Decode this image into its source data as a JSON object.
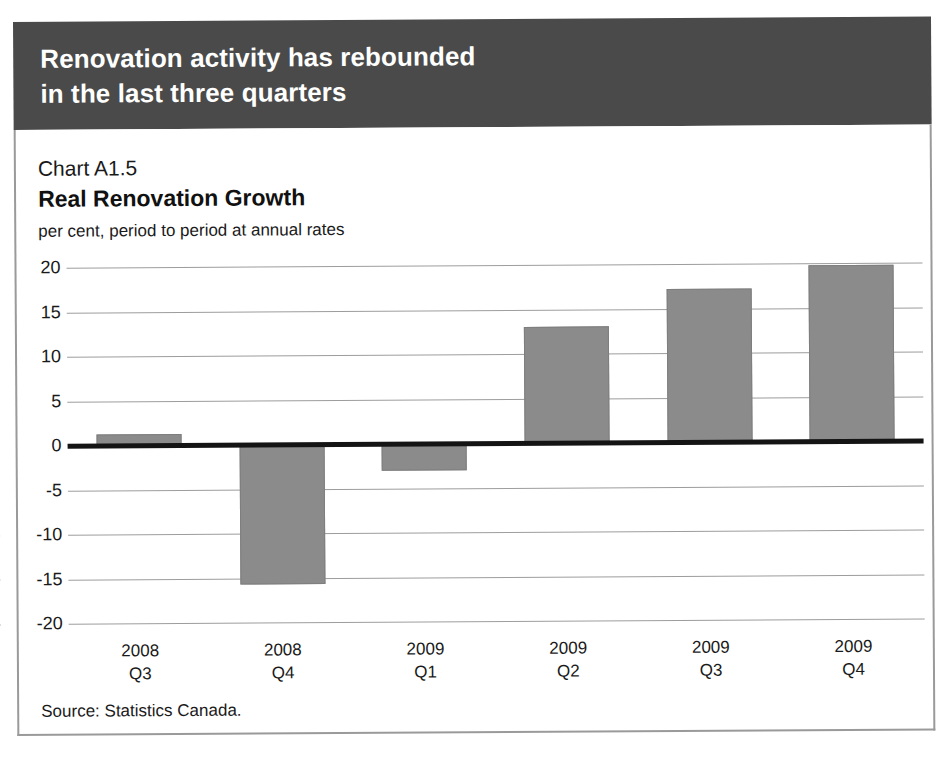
{
  "banner": {
    "line1": "Renovation activity has rebounded",
    "line2": "in the last three quarters",
    "background_color": "#4a4a4a",
    "text_color": "#ffffff"
  },
  "panel": {
    "chart_number": "Chart A1.5",
    "title": "Real Renovation Growth",
    "subtitle": "per cent, period to period at annual rates",
    "source": "Source: Statistics Canada."
  },
  "chart_data": {
    "type": "bar",
    "title": "Real Renovation Growth",
    "subtitle": "Chart A1.5",
    "xlabel": "",
    "ylabel": "per cent, period to period at annual rates",
    "categories": [
      "2008 Q3",
      "2008 Q4",
      "2009 Q1",
      "2009 Q2",
      "2009 Q3",
      "2009 Q4"
    ],
    "category_lines": [
      {
        "year": "2008",
        "quarter": "Q3"
      },
      {
        "year": "2008",
        "quarter": "Q4"
      },
      {
        "year": "2009",
        "quarter": "Q1"
      },
      {
        "year": "2009",
        "quarter": "Q2"
      },
      {
        "year": "2009",
        "quarter": "Q3"
      },
      {
        "year": "2009",
        "quarter": "Q4"
      }
    ],
    "values": [
      1.2,
      -15.7,
      -3.0,
      13.0,
      17.2,
      19.8
    ],
    "ylim": [
      -20,
      20
    ],
    "yticks": [
      20,
      15,
      10,
      5,
      0,
      -5,
      -10,
      -15,
      -20
    ],
    "ytick_labels": [
      "20",
      "15",
      "10",
      "5",
      "0",
      "-5",
      "-10",
      "-15",
      "-20"
    ],
    "grid": true,
    "legend": false,
    "bar_color": "#8b8b8b",
    "zero_line_color": "#141414",
    "gridline_color": "#9d9d9d",
    "source": "Source: Statistics Canada."
  }
}
